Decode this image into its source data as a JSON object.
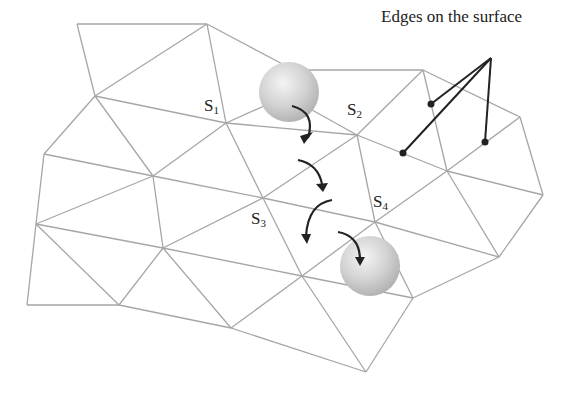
{
  "diagram": {
    "annotation": "Edges on the surface",
    "labels": [
      {
        "id": "S1",
        "base": "S",
        "sub": "1",
        "x": 204,
        "y": 97
      },
      {
        "id": "S2",
        "base": "S",
        "sub": "2",
        "x": 347,
        "y": 101
      },
      {
        "id": "S3",
        "base": "S",
        "sub": "3",
        "x": 251,
        "y": 210
      },
      {
        "id": "S4",
        "base": "S",
        "sub": "4",
        "x": 373,
        "y": 193
      }
    ],
    "colors": {
      "mesh_edge": "#a6a6a6",
      "pointer": "#222222",
      "sphere": "#cfcfcf",
      "text": "#222222"
    },
    "vertices": {
      "A": [
        77,
        24
      ],
      "B": [
        207,
        24
      ],
      "C": [
        95,
        96
      ],
      "D": [
        44,
        154
      ],
      "S1": [
        226,
        123
      ],
      "E": [
        153,
        176
      ],
      "F": [
        36,
        224
      ],
      "G": [
        163,
        248
      ],
      "S3": [
        263,
        198
      ],
      "H": [
        27,
        305
      ],
      "I": [
        119,
        305
      ],
      "J": [
        231,
        328
      ],
      "K": [
        366,
        372
      ],
      "X": [
        290,
        92
      ],
      "M": [
        423,
        70
      ],
      "S2": [
        357,
        135
      ],
      "N": [
        520,
        117
      ],
      "O": [
        447,
        171
      ],
      "P": [
        543,
        195
      ],
      "S4": [
        375,
        222
      ],
      "Q": [
        302,
        276
      ],
      "R": [
        413,
        298
      ],
      "T": [
        499,
        257
      ]
    },
    "spheres": [
      {
        "id": "start-sphere",
        "cx": 289,
        "cy": 92,
        "r": 30
      },
      {
        "id": "end-sphere",
        "cx": 370,
        "cy": 266,
        "r": 30
      }
    ],
    "pointer_dots": [
      [
        431,
        104
      ],
      [
        403,
        153
      ],
      [
        485,
        142
      ]
    ],
    "pointer_origin": [
      491,
      58
    ]
  }
}
